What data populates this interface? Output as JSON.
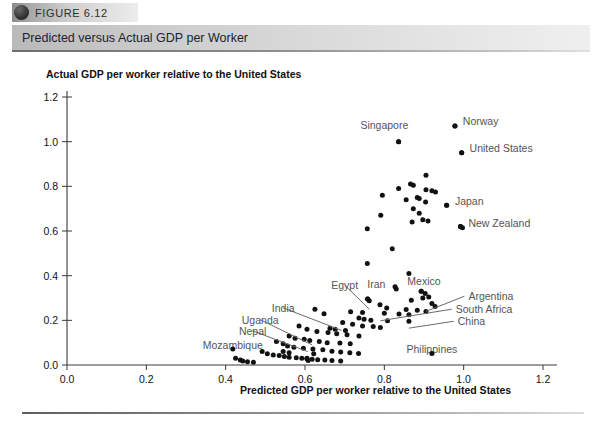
{
  "figure": {
    "tab_label": "FIGURE 6.12",
    "title": "Predicted versus Actual GDP per Worker"
  },
  "chart_data": {
    "type": "scatter",
    "title": "Predicted versus Actual GDP per Worker",
    "xlabel": "Predicted GDP per worker relative to the United States",
    "ylabel": "Actual GDP per worker relative to the United States",
    "xlim": [
      0.0,
      1.25
    ],
    "ylim": [
      0.0,
      1.25
    ],
    "xticks": [
      "0.0",
      "0.2",
      "0.4",
      "0.6",
      "0.8",
      "1.0",
      "1.2"
    ],
    "xtick_values": [
      0.0,
      0.2,
      0.4,
      0.6,
      0.8,
      1.0,
      1.2
    ],
    "yticks": [
      "0.0",
      "0.2",
      "0.4",
      "0.6",
      "0.8",
      "1.0",
      "1.2"
    ],
    "ytick_values": [
      0.0,
      0.2,
      0.4,
      0.6,
      0.8,
      1.0,
      1.2
    ],
    "grid": false,
    "legend": "none",
    "marker_color": "#111111",
    "points": [
      [
        0.978,
        1.07
      ],
      [
        0.836,
        1.0
      ],
      [
        0.995,
        0.95
      ],
      [
        0.905,
        0.85
      ],
      [
        0.866,
        0.81
      ],
      [
        0.873,
        0.805
      ],
      [
        0.836,
        0.79
      ],
      [
        0.905,
        0.785
      ],
      [
        0.92,
        0.78
      ],
      [
        0.929,
        0.775
      ],
      [
        0.883,
        0.75
      ],
      [
        0.888,
        0.745
      ],
      [
        0.855,
        0.74
      ],
      [
        0.904,
        0.73
      ],
      [
        0.795,
        0.76
      ],
      [
        0.957,
        0.715
      ],
      [
        0.873,
        0.7
      ],
      [
        0.888,
        0.68
      ],
      [
        0.791,
        0.67
      ],
      [
        0.897,
        0.65
      ],
      [
        0.91,
        0.645
      ],
      [
        0.87,
        0.64
      ],
      [
        0.992,
        0.62
      ],
      [
        0.997,
        0.615
      ],
      [
        0.757,
        0.61
      ],
      [
        0.82,
        0.52
      ],
      [
        0.757,
        0.455
      ],
      [
        0.862,
        0.41
      ],
      [
        0.827,
        0.35
      ],
      [
        0.83,
        0.34
      ],
      [
        0.893,
        0.33
      ],
      [
        0.903,
        0.32
      ],
      [
        0.912,
        0.305
      ],
      [
        0.897,
        0.3
      ],
      [
        0.758,
        0.295
      ],
      [
        0.762,
        0.288
      ],
      [
        0.868,
        0.29
      ],
      [
        0.92,
        0.275
      ],
      [
        0.928,
        0.262
      ],
      [
        0.789,
        0.27
      ],
      [
        0.806,
        0.255
      ],
      [
        0.855,
        0.248
      ],
      [
        0.883,
        0.245
      ],
      [
        0.905,
        0.24
      ],
      [
        0.715,
        0.238
      ],
      [
        0.745,
        0.235
      ],
      [
        0.8,
        0.232
      ],
      [
        0.837,
        0.228
      ],
      [
        0.862,
        0.225
      ],
      [
        0.625,
        0.25
      ],
      [
        0.648,
        0.23
      ],
      [
        0.736,
        0.21
      ],
      [
        0.749,
        0.205
      ],
      [
        0.766,
        0.2
      ],
      [
        0.808,
        0.198
      ],
      [
        0.862,
        0.196
      ],
      [
        0.695,
        0.19
      ],
      [
        0.72,
        0.182
      ],
      [
        0.745,
        0.175
      ],
      [
        0.772,
        0.172
      ],
      [
        0.79,
        0.168
      ],
      [
        0.663,
        0.165
      ],
      [
        0.676,
        0.16
      ],
      [
        0.702,
        0.155
      ],
      [
        0.585,
        0.175
      ],
      [
        0.605,
        0.16
      ],
      [
        0.63,
        0.15
      ],
      [
        0.658,
        0.145
      ],
      [
        0.68,
        0.14
      ],
      [
        0.706,
        0.135
      ],
      [
        0.736,
        0.13
      ],
      [
        0.56,
        0.13
      ],
      [
        0.575,
        0.12
      ],
      [
        0.598,
        0.115
      ],
      [
        0.612,
        0.11
      ],
      [
        0.636,
        0.105
      ],
      [
        0.656,
        0.1
      ],
      [
        0.688,
        0.098
      ],
      [
        0.714,
        0.095
      ],
      [
        0.528,
        0.105
      ],
      [
        0.545,
        0.095
      ],
      [
        0.556,
        0.085
      ],
      [
        0.572,
        0.08
      ],
      [
        0.596,
        0.075
      ],
      [
        0.62,
        0.072
      ],
      [
        0.645,
        0.068
      ],
      [
        0.668,
        0.062
      ],
      [
        0.69,
        0.058
      ],
      [
        0.713,
        0.055
      ],
      [
        0.735,
        0.052
      ],
      [
        0.492,
        0.06
      ],
      [
        0.505,
        0.05
      ],
      [
        0.52,
        0.045
      ],
      [
        0.535,
        0.042
      ],
      [
        0.548,
        0.038
      ],
      [
        0.56,
        0.035
      ],
      [
        0.578,
        0.032
      ],
      [
        0.592,
        0.03
      ],
      [
        0.605,
        0.028
      ],
      [
        0.618,
        0.026
      ],
      [
        0.632,
        0.024
      ],
      [
        0.65,
        0.022
      ],
      [
        0.668,
        0.02
      ],
      [
        0.69,
        0.018
      ],
      [
        0.425,
        0.03
      ],
      [
        0.437,
        0.022
      ],
      [
        0.443,
        0.018
      ],
      [
        0.455,
        0.015
      ],
      [
        0.47,
        0.012
      ],
      [
        0.605,
        0.03
      ],
      [
        0.608,
        0.02
      ],
      [
        0.56,
        0.055
      ],
      [
        0.622,
        0.05
      ],
      [
        0.545,
        0.06
      ]
    ],
    "annotations": [
      {
        "label": "Norway",
        "lx": 0.998,
        "ly": 1.075,
        "px": 0.978,
        "py": 1.07,
        "anchor": "start",
        "leader": false
      },
      {
        "label": "Singapore",
        "lx": 0.8,
        "ly": 1.055,
        "px": 0.836,
        "py": 1.0,
        "anchor": "middle",
        "leader": false
      },
      {
        "label": "United States",
        "lx": 1.015,
        "ly": 0.952,
        "px": 0.995,
        "py": 0.95,
        "anchor": "start",
        "leader": false
      },
      {
        "label": "Japan",
        "lx": 0.978,
        "ly": 0.718,
        "px": 0.957,
        "py": 0.715,
        "anchor": "start",
        "leader": false
      },
      {
        "label": "New Zealand",
        "lx": 1.012,
        "ly": 0.62,
        "px": 0.992,
        "py": 0.62,
        "anchor": "start",
        "leader": false
      },
      {
        "label": "Mexico",
        "lx": 0.9,
        "ly": 0.36,
        "px": 0.893,
        "py": 0.33,
        "anchor": "middle",
        "leader": false
      },
      {
        "label": "Iran",
        "lx": 0.78,
        "ly": 0.345,
        "px": 0.758,
        "py": 0.295,
        "anchor": "middle",
        "leader": false
      },
      {
        "label": "Egypt",
        "lx": 0.7,
        "ly": 0.34,
        "px": 0.762,
        "py": 0.25,
        "anchor": "middle",
        "leader": true
      },
      {
        "label": "Argentina",
        "lx": 1.012,
        "ly": 0.29,
        "px": 0.905,
        "py": 0.24,
        "anchor": "start",
        "leader": true
      },
      {
        "label": "South Africa",
        "lx": 0.98,
        "ly": 0.232,
        "px": 0.79,
        "py": 0.198,
        "anchor": "start",
        "leader": true
      },
      {
        "label": "China",
        "lx": 0.985,
        "ly": 0.178,
        "px": 0.862,
        "py": 0.165,
        "anchor": "start",
        "leader": true
      },
      {
        "label": "Philippines",
        "lx": 0.92,
        "ly": 0.052,
        "px": 0.92,
        "py": 0.052,
        "anchor": "middle",
        "leader": false
      },
      {
        "label": "India",
        "lx": 0.545,
        "ly": 0.238,
        "px": 0.692,
        "py": 0.155,
        "anchor": "middle",
        "leader": true
      },
      {
        "label": "Uganda",
        "lx": 0.487,
        "ly": 0.185,
        "px": 0.618,
        "py": 0.09,
        "anchor": "middle",
        "leader": true
      },
      {
        "label": "Nepal",
        "lx": 0.468,
        "ly": 0.135,
        "px": 0.607,
        "py": 0.06,
        "anchor": "middle",
        "leader": true
      },
      {
        "label": "Mozambique",
        "lx": 0.418,
        "ly": 0.072,
        "px": 0.418,
        "py": 0.072,
        "anchor": "middle",
        "leader": false
      }
    ]
  }
}
